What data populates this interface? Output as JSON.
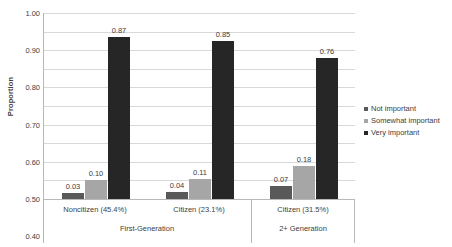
{
  "chart_data": {
    "type": "bar",
    "title": "",
    "xlabel": "",
    "ylabel": "Proportion",
    "ylim": [
      0,
      1.0
    ],
    "ytick_step": 0.1,
    "grid": true,
    "legend_position": "right",
    "categories": [
      "Noncitizen (45.4%)",
      "Citizen (23.1%)",
      "Citizen (31.5%)"
    ],
    "group_labels": [
      "First-Generation",
      "2+ Generation"
    ],
    "groups": [
      {
        "label": "First-Generation",
        "categories": [
          "Noncitizen (45.4%)",
          "Citizen (23.1%)"
        ]
      },
      {
        "label": "2+ Generation",
        "categories": [
          "Citizen (31.5%)"
        ]
      }
    ],
    "series": [
      {
        "name": "Not important",
        "color": "#595959",
        "values": [
          0.03,
          0.04,
          0.07
        ]
      },
      {
        "name": "Somewhat important",
        "color": "#a6a6a6",
        "values": [
          0.1,
          0.11,
          0.18
        ]
      },
      {
        "name": "Very important",
        "color": "#262626",
        "values": [
          0.87,
          0.85,
          0.76
        ]
      }
    ],
    "ytick_labels": [
      "1.00",
      "0.90",
      "0.80",
      "0.70",
      "0.60",
      "0.50",
      "0.40",
      "0.30",
      "0.20",
      "0.10",
      "0.00"
    ],
    "data_labels": [
      [
        "0.03",
        "0.10",
        "0.87"
      ],
      [
        "0.04",
        "0.11",
        "0.85"
      ],
      [
        "0.07",
        "0.18",
        "0.76"
      ]
    ]
  },
  "legend": {
    "items": [
      {
        "label": "Not important",
        "color": "#595959"
      },
      {
        "label": "Somewhat important",
        "color": "#a6a6a6"
      },
      {
        "label": "Very important",
        "color": "#262626"
      }
    ]
  }
}
